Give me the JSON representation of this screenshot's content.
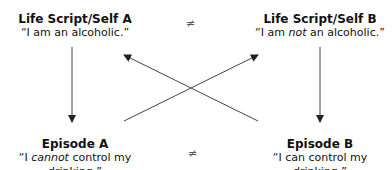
{
  "nodes": {
    "top_left": {
      "title": "Life Script/Self A",
      "quote_pre": "“I am an alcoholic.”",
      "quote_em": "",
      "quote_post": ""
    },
    "top_right": {
      "title": "Life Script/Self B",
      "quote_pre": "“I am ",
      "quote_em": "not",
      "quote_post": " an alcoholic.”"
    },
    "bottom_left": {
      "title": "Episode A",
      "quote_pre": "“I ",
      "quote_em": "cannot",
      "quote_post": " control my drinking.”"
    },
    "bottom_right": {
      "title": "Episode B",
      "quote_pre": "“I can control my drinking.”",
      "quote_em": "",
      "quote_post": ""
    }
  },
  "symbols": {
    "top_neq": "≠",
    "bottom_neq": "≠"
  },
  "colors": {
    "arrow": "#333333",
    "text": "#111111"
  }
}
